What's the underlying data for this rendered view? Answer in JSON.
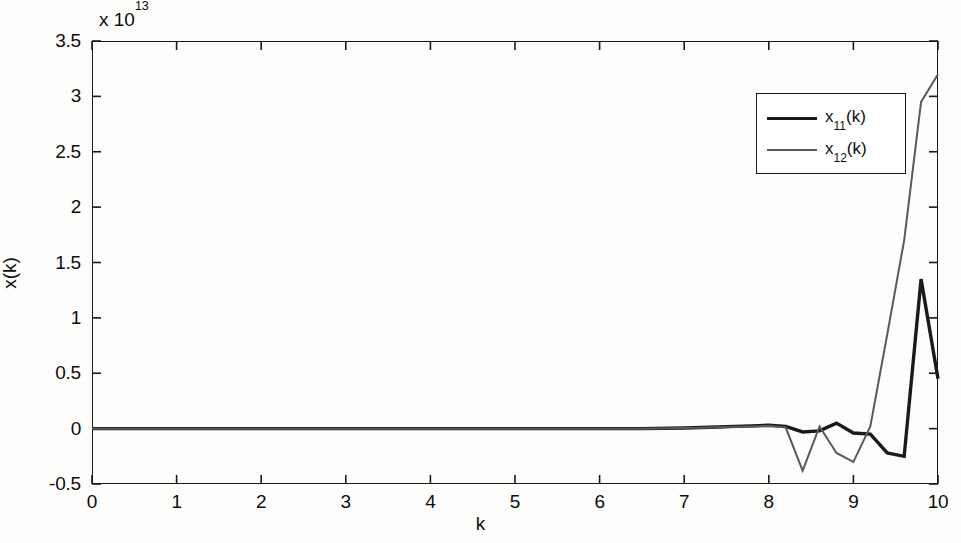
{
  "figure": {
    "width": 961,
    "height": 543,
    "background": "#fdfdfc"
  },
  "axis_label_x": "k",
  "axis_label_y": "x(k)",
  "exponent_prefix": "x 10",
  "exponent_power": "13",
  "legend": {
    "entries": [
      {
        "label_base": "x",
        "label_sub": "11",
        "label_suffix": "(k)",
        "color": "#1a1a1a",
        "width": 3.4
      },
      {
        "label_base": "x",
        "label_sub": "12",
        "label_suffix": "(k)",
        "color": "#5a5a5a",
        "width": 2.0
      }
    ]
  },
  "chart_data": {
    "type": "line",
    "title": "",
    "xlabel": "k",
    "ylabel": "x(k)",
    "y_multiplier": 10000000000000.0,
    "y_multiplier_text": "x 10^13",
    "xlim": [
      0,
      10
    ],
    "ylim": [
      -0.5,
      3.5
    ],
    "xticks": [
      0,
      1,
      2,
      3,
      4,
      5,
      6,
      7,
      8,
      9,
      10
    ],
    "xticklabels": [
      "0",
      "1",
      "2",
      "3",
      "4",
      "5",
      "6",
      "7",
      "8",
      "9",
      "10"
    ],
    "yticks": [
      -0.5,
      0,
      0.5,
      1,
      1.5,
      2,
      2.5,
      3,
      3.5
    ],
    "yticklabels": [
      "-0.5",
      "0",
      "0.5",
      "1",
      "1.5",
      "2",
      "2.5",
      "3",
      "3.5"
    ],
    "grid": false,
    "legend_position": "upper right",
    "series": [
      {
        "name": "x_11(k)",
        "color": "#1a1a1a",
        "width": 3.4,
        "x": [
          0,
          0.5,
          1,
          1.5,
          2,
          2.5,
          3,
          3.5,
          4,
          4.5,
          5,
          5.5,
          6,
          6.5,
          7,
          7.2,
          7.4,
          7.6,
          7.8,
          8.0,
          8.2,
          8.4,
          8.6,
          8.8,
          9.0,
          9.2,
          9.4,
          9.6,
          9.8,
          10
        ],
        "y": [
          0,
          0,
          0,
          0,
          0,
          0,
          0,
          0,
          0,
          0,
          0,
          0,
          0,
          0,
          0.005,
          0.01,
          0.015,
          0.02,
          0.025,
          0.03,
          0.02,
          -0.03,
          -0.02,
          0.05,
          -0.04,
          -0.05,
          -0.22,
          -0.25,
          1.35,
          0.45
        ]
      },
      {
        "name": "x_12(k)",
        "color": "#5a5a5a",
        "width": 2.0,
        "x": [
          0,
          0.5,
          1,
          1.5,
          2,
          2.5,
          3,
          3.5,
          4,
          4.5,
          5,
          5.5,
          6,
          6.5,
          7,
          7.2,
          7.4,
          7.6,
          7.8,
          8.0,
          8.2,
          8.4,
          8.6,
          8.8,
          9.0,
          9.2,
          9.4,
          9.6,
          9.8,
          10
        ],
        "y": [
          0,
          0,
          0,
          0,
          0,
          0,
          0,
          0,
          0,
          0,
          0,
          0,
          0,
          0,
          0.005,
          0.008,
          0.012,
          0.016,
          0.02,
          0.025,
          0.01,
          -0.38,
          0.02,
          -0.22,
          -0.3,
          0.02,
          0.85,
          1.7,
          2.95,
          3.2
        ]
      }
    ]
  }
}
